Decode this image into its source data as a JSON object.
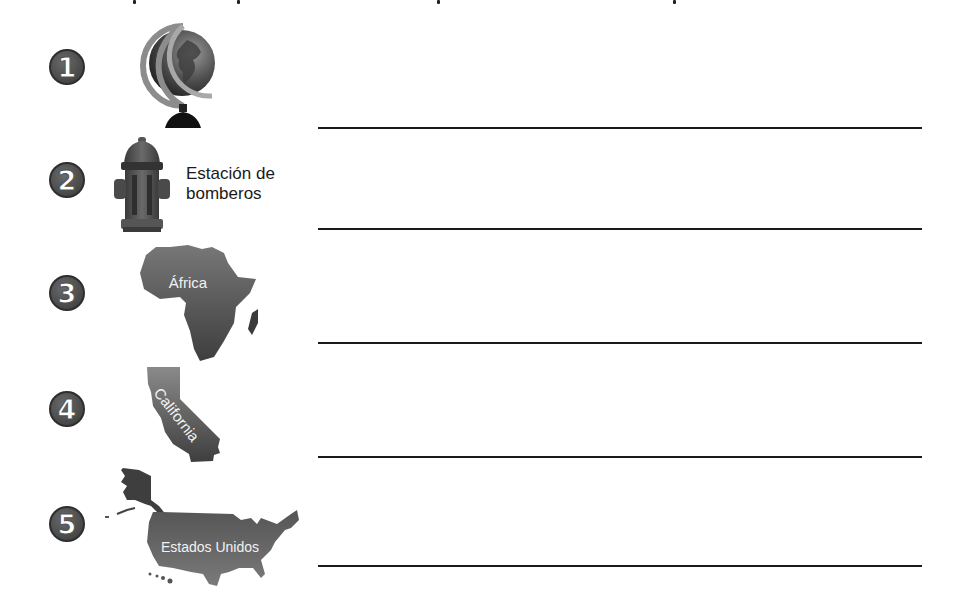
{
  "worksheet": {
    "items": [
      {
        "number": "1",
        "icon": "globe-icon",
        "label": ""
      },
      {
        "number": "2",
        "icon": "fire-hydrant-icon",
        "label_line1": "Estación de",
        "label_line2": "bomberos"
      },
      {
        "number": "3",
        "icon": "africa-map-icon",
        "map_label": "África"
      },
      {
        "number": "4",
        "icon": "california-map-icon",
        "map_label": "California"
      },
      {
        "number": "5",
        "icon": "usa-map-icon",
        "map_label": "Estados Unidos"
      }
    ],
    "answer_lines": 5,
    "colors": {
      "badge": "#4c4c4c",
      "map_fill": "#5a5a5a",
      "line": "#1a1a1a",
      "background": "#ffffff"
    }
  }
}
